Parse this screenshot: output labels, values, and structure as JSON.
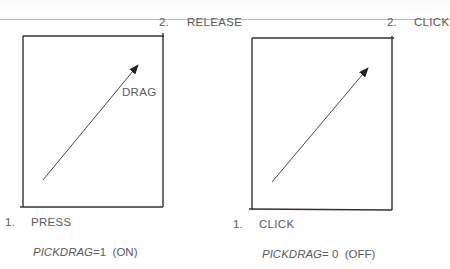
{
  "panels": [
    {
      "id": "pickdrag-on",
      "step1": {
        "num": "1.",
        "label": "PRESS"
      },
      "step2": {
        "num": "2.",
        "label": "RELEASE"
      },
      "arrow_label": "DRAG",
      "setting": {
        "name": "PICKDRAG",
        "eq": "=1",
        "state": "(ON)"
      }
    },
    {
      "id": "pickdrag-off",
      "step1": {
        "num": "1.",
        "label": "CLICK"
      },
      "step2": {
        "num": "2.",
        "label": "CLICK"
      },
      "arrow_label": "",
      "setting": {
        "name": "PICKDRAG",
        "eq": "= 0",
        "state": "(OFF)"
      }
    }
  ],
  "colors": {
    "line": "#333333",
    "text": "#5a5a5a"
  }
}
